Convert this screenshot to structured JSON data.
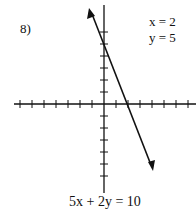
{
  "problem": {
    "number_label": "8)",
    "solution_x": "x = 2",
    "solution_y": "y = 5",
    "equation": "5x + 2y = 10"
  },
  "chart_data": {
    "type": "line",
    "title": "5x + 2y = 10",
    "xlabel": "",
    "ylabel": "",
    "xlim": [
      -8,
      8
    ],
    "ylim": [
      -7,
      8
    ],
    "grid": false,
    "tick_spacing": 1,
    "x_ticks_negative": [
      -1,
      -2,
      -3,
      -4,
      -5,
      -6,
      -7
    ],
    "x_ticks_positive": [
      1,
      2,
      3,
      4,
      5,
      6,
      7
    ],
    "y_ticks_positive": [
      1,
      2,
      3,
      4,
      5,
      6
    ],
    "y_ticks_negative": [
      -1,
      -2,
      -3,
      -4,
      -5,
      -6
    ],
    "series": [
      {
        "name": "5x + 2y = 10",
        "slope": -2.5,
        "y_intercept": 5,
        "x_intercept": 2,
        "points": [
          [
            -1.25,
            8.1
          ],
          [
            0,
            5
          ],
          [
            2,
            0
          ],
          [
            4.1,
            -5.5
          ]
        ],
        "arrows_both_ends": true
      }
    ],
    "annotations": [
      "x = 2",
      "y = 5"
    ],
    "color": "#111111"
  }
}
